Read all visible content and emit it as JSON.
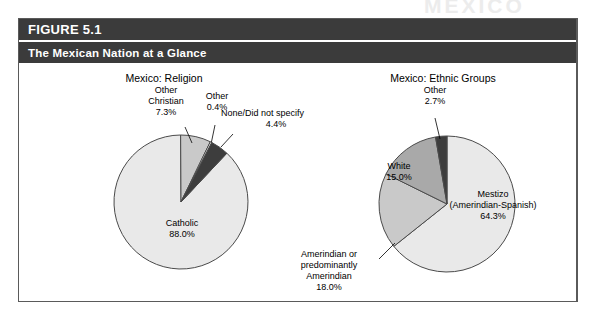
{
  "page": {
    "watermark_text": "MEXICO"
  },
  "figure": {
    "number_label": "FIGURE 5.1",
    "title": "The Mexican Nation at a Glance"
  },
  "colors": {
    "header_bar": "#3b3b3b",
    "frame_border": "#5a5a5a",
    "slice_lightest": "#e9e9e9",
    "slice_light": "#c9c9c9",
    "slice_medium": "#a9a9a9",
    "slice_dark": "#3d3d3d",
    "slice_white": "#fbfbfb",
    "outline": "#4a4a4a"
  },
  "chart_data": [
    {
      "type": "pie",
      "id": "religion",
      "title": "Mexico: Religion",
      "categories": [
        "Catholic",
        "Other Christian",
        "Other",
        "None/Did not specify"
      ],
      "values": [
        88.0,
        7.3,
        0.4,
        4.4
      ],
      "value_labels": [
        "88.0%",
        "7.3%",
        "0.4%",
        "4.4%"
      ],
      "slice_colors": [
        "#e9e9e9",
        "#c9c9c9",
        "#fbfbfb",
        "#3d3d3d"
      ],
      "legend": "none",
      "labels_inline": true,
      "annotations": [
        {
          "name": "Catholic",
          "text": "Catholic",
          "value": "88.0%"
        },
        {
          "name": "Other Christian",
          "text": "Other\nChristian",
          "value": "7.3%"
        },
        {
          "name": "Other",
          "text": "Other",
          "value": "0.4%"
        },
        {
          "name": "None/Did not specify",
          "text": "None/Did not specify",
          "value": "4.4%"
        }
      ]
    },
    {
      "type": "pie",
      "id": "ethnic",
      "title": "Mexico: Ethnic Groups",
      "categories": [
        "Mestizo (Amerindian-Spanish)",
        "Amerindian or predominantly Amerindian",
        "White",
        "Other"
      ],
      "values": [
        64.3,
        18.0,
        15.0,
        2.7
      ],
      "value_labels": [
        "64.3%",
        "18.0%",
        "15.0%",
        "2.7%"
      ],
      "slice_colors": [
        "#e9e9e9",
        "#c9c9c9",
        "#a9a9a9",
        "#3d3d3d"
      ],
      "legend": "none",
      "labels_inline": true,
      "annotations": [
        {
          "name": "Mestizo",
          "text": "Mestizo\n(Amerindian-Spanish)",
          "value": "64.3%"
        },
        {
          "name": "Amerindian",
          "text": "Amerindian or\npredominantly\nAmerindian",
          "value": "18.0%"
        },
        {
          "name": "White",
          "text": "White",
          "value": "15.0%"
        },
        {
          "name": "Other",
          "text": "Other",
          "value": "2.7%"
        }
      ]
    }
  ],
  "religion_labels": {
    "title": "Mexico: Religion",
    "catholic_name": "Catholic",
    "catholic_value": "88.0%",
    "other_christian_line1": "Other",
    "other_christian_line2": "Christian",
    "other_christian_value": "7.3%",
    "other_name": "Other",
    "other_value": "0.4%",
    "none_name": "None/Did not specify",
    "none_value": "4.4%"
  },
  "ethnic_labels": {
    "title": "Mexico: Ethnic Groups",
    "mestizo_line1": "Mestizo",
    "mestizo_line2": "(Amerindian-Spanish)",
    "mestizo_value": "64.3%",
    "amerindian_line1": "Amerindian or",
    "amerindian_line2": "predominantly",
    "amerindian_line3": "Amerindian",
    "amerindian_value": "18.0%",
    "white_name": "White",
    "white_value": "15.0%",
    "other_name": "Other",
    "other_value": "2.7%"
  }
}
